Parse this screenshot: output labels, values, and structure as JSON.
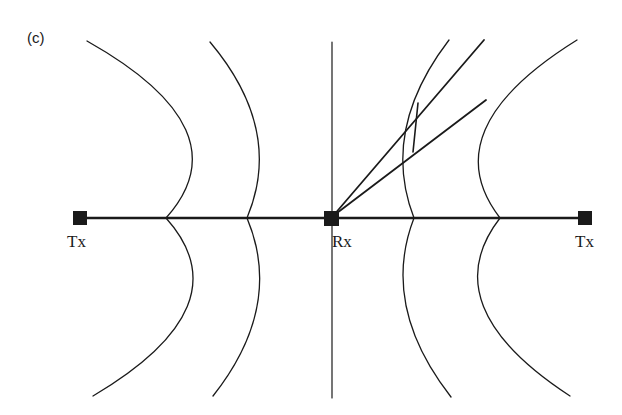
{
  "figure": {
    "panel_label": "(c)",
    "labels": {
      "tx_left": "Tx",
      "rx": "Rx",
      "tx_right": "Tx"
    },
    "colors": {
      "stroke": "#1a1a1a",
      "background": "#ffffff"
    },
    "elements": {
      "baseline": "horizontal line connecting Tx, Rx, Tx",
      "vertical_axis": "vertical line through Rx",
      "wavefronts_left": 2,
      "wavefronts_right": 2,
      "rays_from_rx": 2,
      "ray_segment": "short connecting segment between rays at right inner wavefront"
    }
  }
}
